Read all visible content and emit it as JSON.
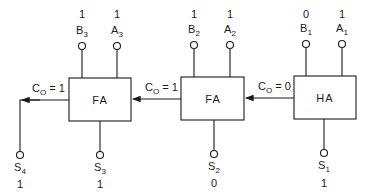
{
  "diagram": {
    "type": "4-bit binary adder (ripple carry)",
    "blocks": [
      {
        "id": "fa3",
        "label": "FA",
        "inputs": {
          "B": {
            "name": "B",
            "sub": "3",
            "value": "1"
          },
          "A": {
            "name": "A",
            "sub": "3",
            "value": "1"
          }
        },
        "sum": {
          "name": "S",
          "sub": "3",
          "value": "1"
        },
        "carry_out": {
          "name": "C",
          "sub": "O",
          "value": "1"
        }
      },
      {
        "id": "fa2",
        "label": "FA",
        "inputs": {
          "B": {
            "name": "B",
            "sub": "2",
            "value": "1"
          },
          "A": {
            "name": "A",
            "sub": "2",
            "value": "1"
          }
        },
        "sum": {
          "name": "S",
          "sub": "2",
          "value": "0"
        },
        "carry_out": {
          "name": "C",
          "sub": "O",
          "value": "1"
        }
      },
      {
        "id": "ha1",
        "label": "HA",
        "inputs": {
          "B": {
            "name": "B",
            "sub": "1",
            "value": "0"
          },
          "A": {
            "name": "A",
            "sub": "1",
            "value": "1"
          }
        },
        "sum": {
          "name": "S",
          "sub": "1",
          "value": "1"
        },
        "carry_out": {
          "name": "C",
          "sub": "O",
          "value": "0"
        }
      }
    ],
    "final_carry_output": {
      "name": "S",
      "sub": "4",
      "value": "1"
    },
    "carry_eq": " = ",
    "colors": {
      "line": "#1a1a1a",
      "background": "#ffffff"
    }
  }
}
